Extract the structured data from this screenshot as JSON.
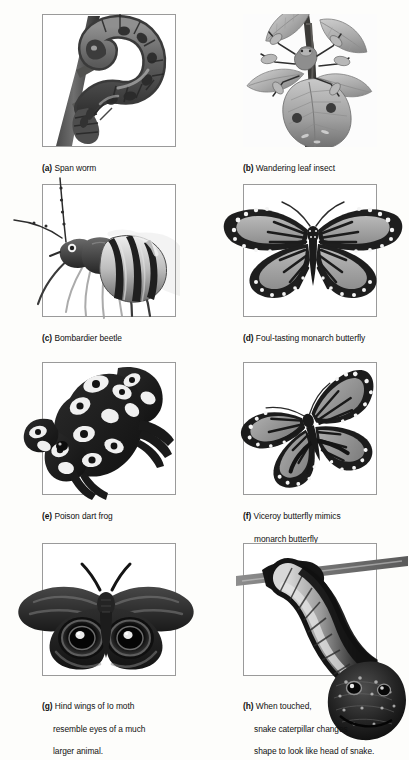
{
  "figure": {
    "type": "biology-plate",
    "columns": 2,
    "rows": 4,
    "style": "grayscale scientific illustration plate"
  },
  "panels": [
    {
      "id": "a",
      "label": "(a)",
      "letter": "a",
      "caption_lines": [
        "Span worm"
      ],
      "caption": "Span worm",
      "subject": "span-worm-caterpillar-on-twig",
      "column": "left",
      "row": 1
    },
    {
      "id": "b",
      "label": "(b)",
      "letter": "b",
      "caption_lines": [
        "Wandering leaf insect"
      ],
      "caption": "Wandering leaf insect",
      "subject": "wandering-leaf-insect-on-branch",
      "column": "right",
      "row": 1
    },
    {
      "id": "c",
      "label": "(c)",
      "letter": "c",
      "caption_lines": [
        "Bombardier beetle"
      ],
      "caption": "Bombardier beetle",
      "subject": "bombardier-beetle",
      "column": "left",
      "row": 2
    },
    {
      "id": "d",
      "label": "(d)",
      "letter": "d",
      "caption_lines": [
        "Foul-tasting monarch butterfly"
      ],
      "caption": "Foul-tasting monarch butterfly",
      "subject": "monarch-butterfly",
      "column": "right",
      "row": 2
    },
    {
      "id": "e",
      "label": "(e)",
      "letter": "e",
      "caption_lines": [
        "Poison dart frog"
      ],
      "caption": "Poison dart frog",
      "subject": "poison-dart-frog",
      "column": "left",
      "row": 3
    },
    {
      "id": "f",
      "label": "(f)",
      "letter": "f",
      "caption_lines": [
        "Viceroy butterfly mimics",
        "monarch butterfly"
      ],
      "caption": "Viceroy butterfly mimics monarch butterfly",
      "subject": "viceroy-butterfly",
      "column": "right",
      "row": 3
    },
    {
      "id": "g",
      "label": "(g)",
      "letter": "g",
      "caption_lines": [
        "Hind wings of Io moth",
        "resemble eyes of a much",
        "larger animal."
      ],
      "caption": "Hind wings of Io moth resemble eyes of a much larger animal.",
      "subject": "io-moth-with-eyespots",
      "column": "left",
      "row": 4
    },
    {
      "id": "h",
      "label": "(h)",
      "letter": "h",
      "caption_lines": [
        "When touched,",
        "snake caterpillar changes",
        "shape to look like head of snake."
      ],
      "caption": "When touched, snake caterpillar changes shape to look like head of snake.",
      "subject": "snake-caterpillar-on-twig",
      "column": "right",
      "row": 4
    }
  ],
  "colors": {
    "background": "#fdfdfb",
    "frame_border": "#9a9a9a",
    "caption_text": "#111111",
    "ink_dark": "#2a2a2a",
    "ink_mid": "#7d7d7d",
    "ink_light": "#c4c4c4"
  }
}
